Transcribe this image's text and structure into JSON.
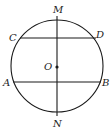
{
  "diagram": {
    "type": "circle-with-chords",
    "colors": {
      "stroke": "#1a1a1a",
      "background": "#ffffff"
    },
    "circle": {
      "cx": 57,
      "cy": 66,
      "r": 46,
      "center_label": "O"
    },
    "diameter": {
      "label_top": "M",
      "label_bottom": "N",
      "x": 57,
      "y1": 16,
      "y2": 116
    },
    "chords": [
      {
        "name": "CD",
        "left_label": "C",
        "right_label": "D",
        "y": 38,
        "x1": 20,
        "x2": 96
      },
      {
        "name": "AB",
        "left_label": "A",
        "right_label": "B",
        "y": 82,
        "x1": 13,
        "x2": 101
      }
    ],
    "labels": {
      "M": "M",
      "N": "N",
      "C": "C",
      "D": "D",
      "A": "A",
      "B": "B",
      "O": "O"
    }
  }
}
